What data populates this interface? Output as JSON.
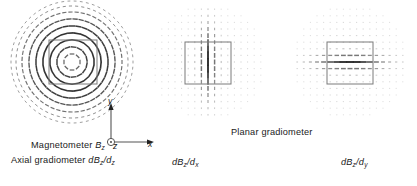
{
  "figure": {
    "title": "",
    "background": "#ffffff",
    "stroke_color": "#1a1a1a",
    "box_color": "#808080"
  },
  "panels": [
    {
      "id": "magnetometer",
      "name": "panel-magnetometer",
      "pattern": "concentric-rings",
      "center": [
        72,
        62
      ],
      "radius": 60,
      "box": {
        "x": 47,
        "y": 40,
        "w": 48,
        "h": 44
      },
      "labels": [
        "Magnetometer Bz",
        "Axial gradiometer dBz/dz"
      ]
    },
    {
      "id": "dbz_dx",
      "name": "panel-dbz-dx",
      "pattern": "vertical-dash-grid",
      "center": [
        209,
        62
      ],
      "radius": 58,
      "box": {
        "x": 185,
        "y": 42,
        "w": 46,
        "h": 42
      },
      "labels": [
        "dBz/dx"
      ]
    },
    {
      "id": "dbz_dy",
      "name": "panel-dbz-dy",
      "pattern": "horizontal-dash-grid",
      "center": [
        350,
        62
      ],
      "radius": 58,
      "box": {
        "x": 327,
        "y": 42,
        "w": 46,
        "h": 42
      },
      "labels": [
        "dBz/dy"
      ]
    }
  ],
  "captions": {
    "magnetometer": {
      "prefix": "Magnetometer ",
      "symbol": "B",
      "subscript": "z"
    },
    "axial_gradiometer": {
      "prefix": "Axial gradiometer ",
      "symbol_num": "dB",
      "sub_num": "z",
      "slash": "/",
      "symbol_den": "d",
      "sub_den": "z"
    },
    "planar_gradiometer": {
      "text": "Planar gradiometer"
    },
    "dbz_dx": {
      "symbol_num": "dB",
      "sub_num": "z",
      "slash": "/",
      "symbol_den": "d",
      "sub_den": "x"
    },
    "dbz_dy": {
      "symbol_num": "dB",
      "sub_num": "z",
      "slash": "/",
      "symbol_den": "d",
      "sub_den": "y"
    }
  },
  "axes_triad": {
    "name": "coordinate-axes",
    "x_label": "x",
    "y_label": "y",
    "z_label": "z",
    "z_symbol": "out-of-page-circle-dot"
  },
  "chart_data": {
    "type": "scatter",
    "title": "",
    "xlabel": "x",
    "ylabel": "y",
    "series": [
      {
        "name": "Magnetometer Bz / Axial gradiometer dBz/dz",
        "pattern": "concentric circular rings of tangential dashes",
        "ring_count": 9,
        "ring_radii": [
          8,
          15,
          22,
          29,
          36,
          43,
          50,
          56,
          61
        ],
        "dash_orientation": "tangential",
        "max_amplitude_at": "mid radius"
      },
      {
        "name": "Planar gradiometer dBz/dx",
        "pattern": "square grid of vertically oriented dashes",
        "grid_spacing": 7,
        "dash_orientation": "vertical (y)",
        "max_amplitude_at": "central vertical band, x near 0"
      },
      {
        "name": "Planar gradiometer dBz/dy",
        "pattern": "square grid of horizontally oriented dashes",
        "grid_spacing": 7,
        "dash_orientation": "horizontal (x)",
        "max_amplitude_at": "central horizontal band, y near 0"
      }
    ],
    "legend": "none",
    "grid": false
  }
}
